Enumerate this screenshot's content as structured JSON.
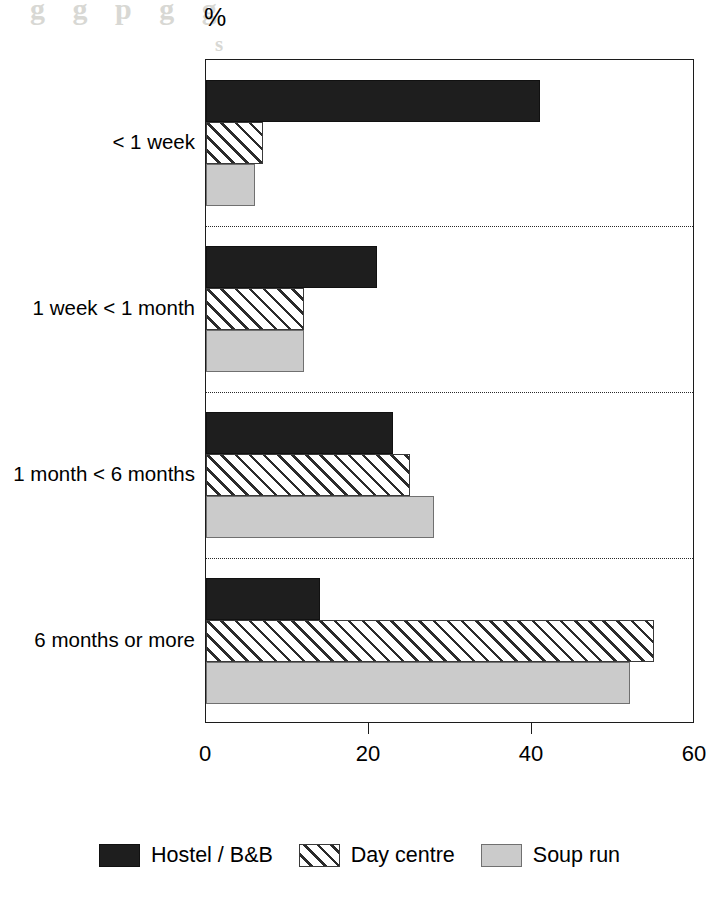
{
  "chart_data": {
    "type": "bar",
    "orientation": "horizontal",
    "title": "",
    "unit_label": "%",
    "xlabel": "",
    "ylabel": "",
    "xlim": [
      0,
      60
    ],
    "xticks": [
      0,
      20,
      40,
      60
    ],
    "xtick_labels": [
      "0",
      "20",
      "40",
      "60"
    ],
    "grid": false,
    "group_separators": true,
    "legend_position": "bottom",
    "categories": [
      "< 1 week",
      "1 week < 1 month",
      "1 month < 6 months",
      "6 months or more"
    ],
    "series": [
      {
        "name": "Hostel / B&B",
        "fill": "solid-black",
        "color": "#1e1e1e",
        "values": [
          41,
          21,
          23,
          14
        ]
      },
      {
        "name": "Day centre",
        "fill": "diagonal-hatch",
        "color": "#ffffff",
        "values": [
          7,
          12,
          25,
          55
        ]
      },
      {
        "name": "Soup run",
        "fill": "solid-light-grey",
        "color": "#cbcbcb",
        "values": [
          6,
          12,
          28,
          52
        ]
      }
    ]
  },
  "legend": {
    "entries": [
      {
        "label": "Hostel / B&B",
        "swatch": "solid-black-swatch"
      },
      {
        "label": "Day centre",
        "swatch": "diagonal-hatch-swatch"
      },
      {
        "label": "Soup run",
        "swatch": "solid-light-grey-swatch"
      }
    ]
  },
  "scan_artifacts": {
    "bleed_lines": [
      "g g p g g",
      "s",
      "d",
      "s"
    ]
  }
}
